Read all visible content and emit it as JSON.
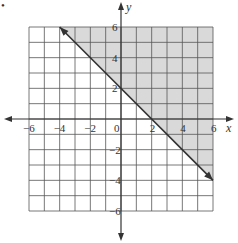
{
  "chart_data": {
    "type": "inequality-graph",
    "title": "",
    "xlabel": "x",
    "ylabel": "y",
    "xlim": [
      -6,
      6
    ],
    "ylim": [
      -6,
      6
    ],
    "grid": true,
    "grid_step": 1,
    "x_ticks": [
      {
        "value": -6,
        "label": "−6"
      },
      {
        "value": -4,
        "label": "−4"
      },
      {
        "value": -2,
        "label": "−2"
      },
      {
        "value": 0,
        "label": "0"
      },
      {
        "value": 2,
        "label": "2"
      },
      {
        "value": 4,
        "label": "4"
      },
      {
        "value": 6,
        "label": "6"
      }
    ],
    "y_ticks": [
      {
        "value": 6,
        "label": "6"
      },
      {
        "value": 4,
        "label": "4"
      },
      {
        "value": 2,
        "label": "2"
      },
      {
        "value": -2,
        "label": "−2"
      },
      {
        "value": -4,
        "label": "−4"
      },
      {
        "value": -6,
        "label": "−6"
      }
    ],
    "line": {
      "equation": "y = -x + 2",
      "style": "solid",
      "points": [
        [
          -4,
          6
        ],
        [
          6,
          -4
        ]
      ],
      "arrows": "both"
    },
    "shaded_region": {
      "inequality": "y >= -x + 2",
      "side": "above",
      "color": "#d9d9d9"
    },
    "colors": {
      "grid": "#555555",
      "axis": "#333333",
      "line": "#333333",
      "shade": "#d9d9d9"
    }
  },
  "marker": "•"
}
